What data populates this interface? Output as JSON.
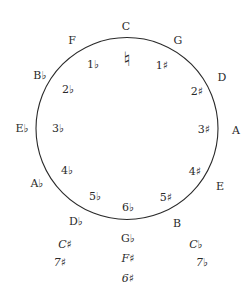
{
  "colors": {
    "ink": "#2a2a2a",
    "background": "#ffffff"
  },
  "top": {
    "key": "C",
    "signature": "♮"
  },
  "sharp_side": [
    {
      "key": "G",
      "signature": "1♯"
    },
    {
      "key": "D",
      "signature": "2♯"
    },
    {
      "key": "A",
      "signature": "3♯"
    },
    {
      "key": "E",
      "signature": "4♯"
    },
    {
      "key": "B",
      "signature": "5♯"
    }
  ],
  "flat_side": [
    {
      "key": "F",
      "signature": "1♭"
    },
    {
      "key": "B♭",
      "signature": "2♭"
    },
    {
      "key": "E♭",
      "signature": "3♭"
    },
    {
      "key": "A♭",
      "signature": "4♭"
    },
    {
      "key": "D♭",
      "signature": "5♭"
    }
  ],
  "bottom": {
    "signature": "6♭",
    "key": "G♭",
    "enharmonic_key": "F♯",
    "enharmonic_signature": "6♯"
  },
  "enharmonic_left": {
    "key": "C♯",
    "signature": "7♯"
  },
  "enharmonic_right": {
    "key": "C♭",
    "signature": "7♭"
  }
}
